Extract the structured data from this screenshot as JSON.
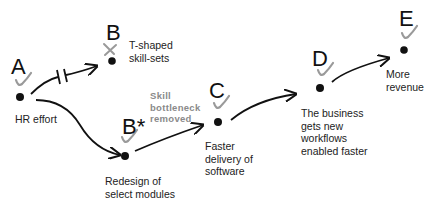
{
  "colors": {
    "ink": "#111111",
    "check": "#9a9a9a",
    "annotation": "#8a8a8a"
  },
  "nodes": [
    {
      "id": "A",
      "letter": "A",
      "status": "check",
      "label": [
        "HR effort"
      ]
    },
    {
      "id": "B",
      "letter": "B",
      "status": "cross",
      "label": [
        "T-shaped",
        "skill-sets"
      ]
    },
    {
      "id": "Bstar",
      "letter": "B*",
      "status": "check",
      "label": [
        "Redesign of",
        "select modules"
      ]
    },
    {
      "id": "C",
      "letter": "C",
      "status": "check",
      "label": [
        "Faster",
        "delivery of",
        "software"
      ]
    },
    {
      "id": "D",
      "letter": "D",
      "status": "check",
      "label": [
        "The business",
        "gets new",
        "workflows",
        "enabled faster"
      ]
    },
    {
      "id": "E",
      "letter": "E",
      "status": "check",
      "label": [
        "More",
        "revenue"
      ]
    }
  ],
  "annotation": [
    "Skill",
    "bottleneck",
    "removed"
  ],
  "edges": [
    {
      "from": "A",
      "to": "B",
      "blocked": true
    },
    {
      "from": "A",
      "to": "Bstar",
      "blocked": false
    },
    {
      "from": "Bstar",
      "to": "C",
      "blocked": false
    },
    {
      "from": "C",
      "to": "D",
      "blocked": false
    },
    {
      "from": "D",
      "to": "E",
      "blocked": false
    }
  ]
}
